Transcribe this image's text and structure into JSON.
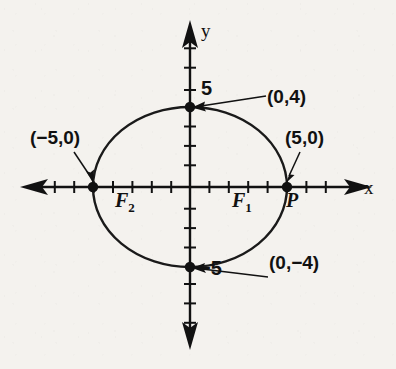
{
  "figure": {
    "axes": {
      "x_label": "x",
      "y_label": "y",
      "origin_px": [
        190,
        187
      ],
      "unit_px_x": 19.4,
      "unit_px_y": 19.4,
      "x_range": [
        -8,
        8
      ],
      "y_range": [
        -7.5,
        7.5
      ],
      "tick_step": 1
    },
    "tick_labels": [
      {
        "name": "y-tick-5",
        "text": "5",
        "value": 5,
        "axis": "y"
      },
      {
        "name": "y-tick-neg5",
        "text": "−5",
        "value": -5,
        "axis": "y"
      }
    ],
    "curve": {
      "type": "ellipse",
      "center": [
        0,
        0
      ],
      "semi_major_a": 5,
      "semi_minor_b": 4,
      "orientation": "horizontal",
      "color": "#111111",
      "stroke_width": 2.2
    },
    "points": [
      {
        "name": "vertex-top",
        "label": "(0,4)",
        "x": 0,
        "y": 4,
        "marker": "filled-dot"
      },
      {
        "name": "vertex-bottom",
        "label": "(0,−4)",
        "x": 0,
        "y": -4,
        "marker": "filled-dot"
      },
      {
        "name": "vertex-left",
        "label": "(−5,0)",
        "x": -5,
        "y": 0,
        "marker": "filled-dot"
      },
      {
        "name": "vertex-right",
        "label": "(5,0)",
        "x": 5,
        "y": 0,
        "marker": "filled-dot"
      }
    ],
    "annotations": [
      {
        "name": "focus-1-label",
        "text": "F",
        "subscript": "1",
        "x": 2.4,
        "y": -0.75
      },
      {
        "name": "focus-2-label",
        "text": "F",
        "subscript": "2",
        "x": -3.4,
        "y": -0.75
      },
      {
        "name": "point-p-label",
        "text": "P",
        "x": 5.2,
        "y": -0.75
      }
    ],
    "colors": {
      "ink": "#111111",
      "paper": "#f4f2ee"
    }
  }
}
